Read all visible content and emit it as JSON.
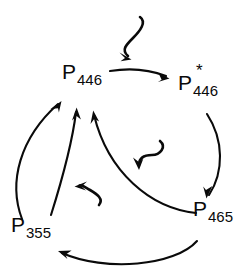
{
  "diagram": {
    "type": "photocycle-scheme",
    "title": "",
    "background_color": "#ffffff",
    "stroke_color": "#0a0a0a",
    "species": [
      {
        "id": "p446-ground",
        "base": "P",
        "subscript": "446",
        "superscript": "",
        "full_label": "P446",
        "position": "upper-left"
      },
      {
        "id": "p446-excited",
        "base": "P",
        "subscript": "446",
        "superscript": "*",
        "full_label": "P446*",
        "position": "upper-right"
      },
      {
        "id": "p465",
        "base": "P",
        "subscript": "465",
        "superscript": "",
        "full_label": "P465",
        "position": "lower-right"
      },
      {
        "id": "p355",
        "base": "P",
        "subscript": "355",
        "superscript": "",
        "full_label": "P355",
        "position": "lower-left"
      }
    ],
    "transitions": [
      {
        "id": "t-p446-to-p446star",
        "from": "p446-ground",
        "to": "p446-excited",
        "style": "arc",
        "label": ""
      },
      {
        "id": "t-p446star-to-p465",
        "from": "p446-excited",
        "to": "p465",
        "style": "arc",
        "label": ""
      },
      {
        "id": "t-p465-to-p355",
        "from": "p465",
        "to": "p355",
        "style": "arc",
        "label": ""
      },
      {
        "id": "t-p355-to-p446-outer",
        "from": "p355",
        "to": "p446-ground",
        "style": "arc",
        "label": ""
      },
      {
        "id": "t-p355-to-p446-inner",
        "from": "p355",
        "to": "p446-ground",
        "style": "arc",
        "label": ""
      },
      {
        "id": "t-p465-to-p446",
        "from": "p465",
        "to": "p446-ground",
        "style": "arc",
        "label": ""
      }
    ],
    "photon_arrows": [
      {
        "id": "photon-top",
        "target": "t-p446-to-p446star",
        "style": "squiggly",
        "direction": "down-left",
        "label": ""
      },
      {
        "id": "photon-middle",
        "target": "t-p465-to-p446",
        "style": "squiggly",
        "direction": "down-left",
        "label": ""
      },
      {
        "id": "photon-lower-left",
        "target": "t-p355-to-p446-inner",
        "style": "squiggly",
        "direction": "left",
        "label": ""
      }
    ]
  }
}
